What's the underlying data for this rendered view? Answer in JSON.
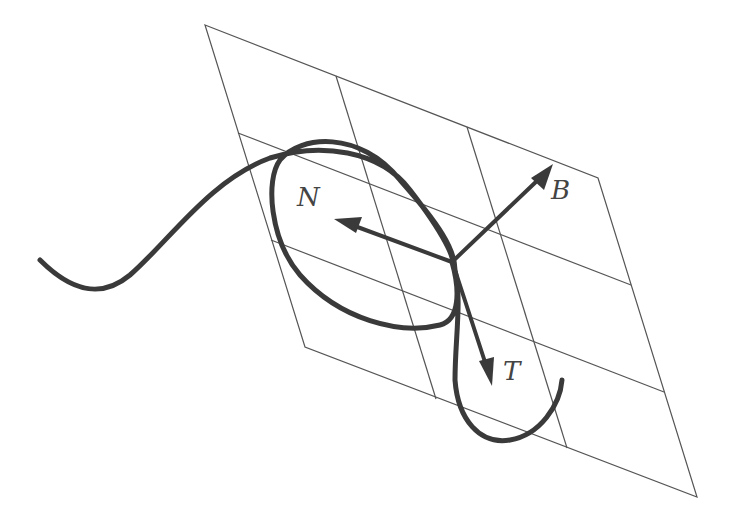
{
  "figure": {
    "labels": {
      "normal": "N",
      "binormal": "B",
      "tangent": "T"
    },
    "colors": {
      "background": "#ffffff",
      "curve": "#3a3a3a",
      "grid": "#555555",
      "label": "#444444"
    }
  }
}
